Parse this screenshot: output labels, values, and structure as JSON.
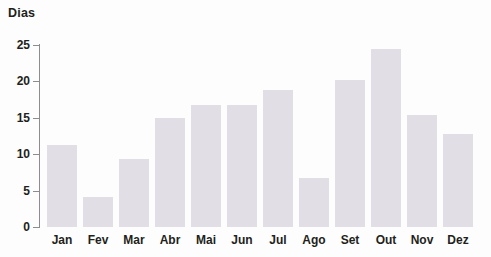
{
  "chart_data": {
    "type": "bar",
    "title": "",
    "ylabel": "Dias",
    "xlabel": "",
    "categories": [
      "Jan",
      "Fev",
      "Mar",
      "Abr",
      "Mai",
      "Jun",
      "Jul",
      "Ago",
      "Set",
      "Out",
      "Nov",
      "Dez"
    ],
    "values": [
      11.3,
      4.1,
      9.3,
      15.0,
      16.8,
      16.8,
      18.8,
      6.7,
      20.2,
      24.5,
      15.4,
      12.8
    ],
    "ylim": [
      0,
      25
    ],
    "yticks": [
      0,
      5,
      10,
      15,
      20,
      25
    ],
    "ytick_labels": [
      "0",
      "5",
      "10",
      "15",
      "20",
      "25"
    ],
    "grid": false,
    "legend": false,
    "bar_color": "#e2dee5",
    "axis_color": "#8e8c8f",
    "text_color": "#231f20"
  }
}
